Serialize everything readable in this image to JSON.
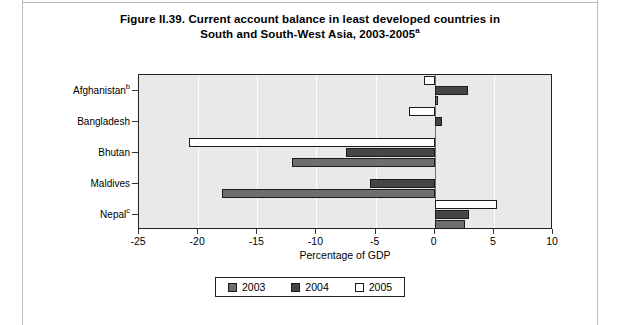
{
  "figure": {
    "title_line1": "Figure II.39. Current account balance in least developed countries in",
    "title_line2": "South and South-West Asia, 2003-2005",
    "title_superscript": "a"
  },
  "axis": {
    "x_title": "Percentage of GDP",
    "x_ticks": [
      "-25",
      "-20",
      "-15",
      "-10",
      "-5",
      "0",
      "5",
      "10"
    ],
    "x_min": -25,
    "x_max": 10,
    "x_step": 5
  },
  "legend": {
    "position": "bottom-center",
    "entries": [
      {
        "label": "2003",
        "color": "#6e6e6e"
      },
      {
        "label": "2004",
        "color": "#454545"
      },
      {
        "label": "2005",
        "color": "#ffffff"
      }
    ]
  },
  "categories": [
    {
      "label": "Afghanistan",
      "superscript": "b"
    },
    {
      "label": "Bangladesh",
      "superscript": ""
    },
    {
      "label": "Bhutan",
      "superscript": ""
    },
    {
      "label": "Maldives",
      "superscript": ""
    },
    {
      "label": "Nepal",
      "superscript": "c"
    }
  ],
  "chart_data": {
    "type": "bar",
    "orientation": "horizontal",
    "title": "Figure II.39. Current account balance in least developed countries in South and South-West Asia, 2003-2005a",
    "xlabel": "Percentage of GDP",
    "ylabel": "",
    "xlim": [
      -25,
      10
    ],
    "xticks": [
      -25,
      -20,
      -15,
      -10,
      -5,
      0,
      5,
      10
    ],
    "grid": "vertical-white-gridlines",
    "legend_position": "bottom-center",
    "categories": [
      "Afghanistan",
      "Bangladesh",
      "Bhutan",
      "Maldives",
      "Nepal"
    ],
    "series": [
      {
        "name": "2003",
        "color": "#6e6e6e",
        "values": [
          0.3,
          0.0,
          -12.1,
          -18.0,
          2.6
        ]
      },
      {
        "name": "2004",
        "color": "#454545",
        "values": [
          2.8,
          0.6,
          -7.5,
          -5.5,
          2.9
        ]
      },
      {
        "name": "2005",
        "color": "#ffffff",
        "values": [
          -0.9,
          -2.2,
          -20.8,
          0.0,
          5.3
        ]
      }
    ]
  },
  "colors": {
    "plot_background": "#e9e9e9",
    "frame": "#222222",
    "gridline": "#ffffff",
    "zero_line": "#6e6e6e"
  }
}
